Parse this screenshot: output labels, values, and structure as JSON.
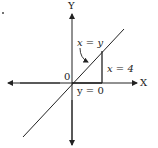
{
  "diagram": {
    "axes": {
      "x_label": "X",
      "y_label": "Y",
      "origin_label": "0"
    },
    "lines": [
      {
        "id": "diagonal",
        "label": "x = y"
      },
      {
        "id": "vertical",
        "label": "x = 4"
      },
      {
        "id": "horizontal",
        "label": "y = 0"
      }
    ],
    "colors": {
      "stroke": "#222222",
      "background": "#ffffff"
    }
  }
}
